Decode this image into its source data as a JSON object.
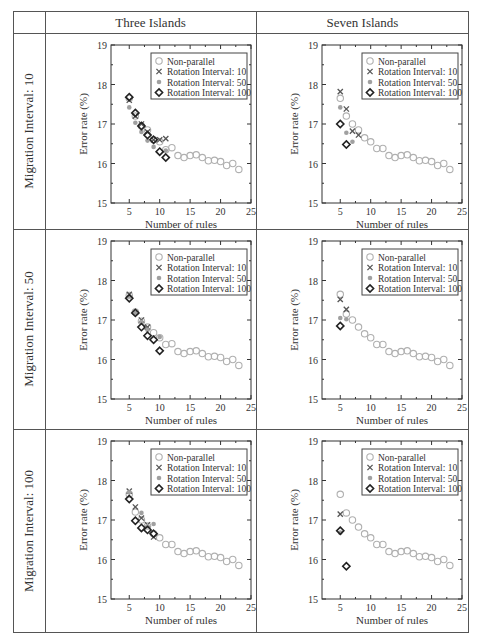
{
  "header": {
    "columns": [
      "Three Islands",
      "Seven Islands"
    ],
    "rows": [
      "Migration Interval: 10",
      "Migration Interval: 50",
      "Migration Interval: 100"
    ]
  },
  "axes": {
    "xlabel": "Number of rules",
    "ylabel": "Error rate (%)",
    "xlim": [
      2,
      25
    ],
    "ylim": [
      15,
      19
    ],
    "xticks": [
      5,
      10,
      15,
      20,
      25
    ],
    "yticks": [
      15,
      16,
      17,
      18,
      19
    ]
  },
  "legend": [
    {
      "name": "Non-parallel",
      "marker": "circle-open",
      "color": "#b0b0b0"
    },
    {
      "name": "Rotation Interval: 10",
      "marker": "x",
      "color": "#555555"
    },
    {
      "name": "Rotation Interval: 50",
      "marker": "dot",
      "color": "#a0a0a0"
    },
    {
      "name": "Rotation Interval: 100",
      "marker": "diamond-open",
      "color": "#222222"
    }
  ],
  "chart_data": [
    {
      "type": "scatter",
      "row": "Migration Interval: 10",
      "column": "Three Islands",
      "xlabel": "Number of rules",
      "ylabel": "Error rate (%)",
      "xlim": [
        2,
        25
      ],
      "ylim": [
        15,
        19
      ],
      "series": [
        {
          "name": "Non-parallel",
          "x": [
            5,
            6,
            7,
            8,
            9,
            10,
            11,
            12,
            13,
            14,
            15,
            16,
            17,
            18,
            19,
            20,
            21,
            22,
            23
          ],
          "y": [
            17.65,
            17.2,
            16.95,
            16.85,
            16.6,
            16.55,
            16.35,
            16.4,
            16.2,
            16.15,
            16.2,
            16.22,
            16.15,
            16.07,
            16.08,
            16.05,
            15.95,
            16.0,
            15.85
          ]
        },
        {
          "name": "Rotation Interval: 10",
          "x": [
            5,
            6,
            7,
            8,
            9,
            10,
            11
          ],
          "y": [
            17.6,
            17.2,
            17.0,
            16.8,
            16.6,
            16.6,
            16.63
          ]
        },
        {
          "name": "Rotation Interval: 50",
          "x": [
            5,
            6,
            7,
            8,
            9,
            11
          ],
          "y": [
            17.42,
            17.03,
            16.8,
            16.58,
            16.42,
            16.33
          ]
        },
        {
          "name": "Rotation Interval: 100",
          "x": [
            5,
            6,
            7,
            8,
            9,
            10,
            11
          ],
          "y": [
            17.68,
            17.28,
            16.95,
            16.72,
            16.6,
            16.3,
            16.15
          ]
        }
      ]
    },
    {
      "type": "scatter",
      "row": "Migration Interval: 10",
      "column": "Seven Islands",
      "xlabel": "Number of rules",
      "ylabel": "Error rate (%)",
      "xlim": [
        2,
        25
      ],
      "ylim": [
        15,
        19
      ],
      "series": [
        {
          "name": "Non-parallel",
          "x": [
            5,
            6,
            7,
            8,
            9,
            10,
            11,
            12,
            13,
            14,
            15,
            16,
            17,
            18,
            19,
            20,
            21,
            22,
            23
          ],
          "y": [
            17.65,
            17.2,
            17.0,
            16.85,
            16.65,
            16.55,
            16.38,
            16.38,
            16.2,
            16.15,
            16.2,
            16.22,
            16.15,
            16.07,
            16.08,
            16.05,
            15.95,
            16.0,
            15.85
          ]
        },
        {
          "name": "Rotation Interval: 10",
          "x": [
            5,
            6,
            7,
            8
          ],
          "y": [
            17.82,
            17.38,
            16.82,
            16.72
          ]
        },
        {
          "name": "Rotation Interval: 50",
          "x": [
            5,
            6,
            7
          ],
          "y": [
            17.42,
            16.78,
            16.55
          ]
        },
        {
          "name": "Rotation Interval: 100",
          "x": [
            5,
            6
          ],
          "y": [
            17.0,
            16.48
          ]
        }
      ]
    },
    {
      "type": "scatter",
      "row": "Migration Interval: 50",
      "column": "Three Islands",
      "xlabel": "Number of rules",
      "ylabel": "Error rate (%)",
      "xlim": [
        2,
        25
      ],
      "ylim": [
        15,
        19
      ],
      "series": [
        {
          "name": "Non-parallel",
          "x": [
            5,
            6,
            7,
            8,
            9,
            10,
            11,
            12,
            13,
            14,
            15,
            16,
            17,
            18,
            19,
            20,
            21,
            22,
            23
          ],
          "y": [
            17.62,
            17.2,
            16.97,
            16.82,
            16.68,
            16.55,
            16.38,
            16.4,
            16.2,
            16.15,
            16.2,
            16.22,
            16.15,
            16.07,
            16.08,
            16.05,
            15.95,
            16.0,
            15.85
          ]
        },
        {
          "name": "Rotation Interval: 10",
          "x": [
            5,
            7,
            8
          ],
          "y": [
            17.65,
            17.0,
            16.82
          ]
        },
        {
          "name": "Rotation Interval: 50",
          "x": [
            5,
            6,
            7,
            8,
            10
          ],
          "y": [
            17.6,
            17.18,
            16.95,
            16.75,
            16.57
          ]
        },
        {
          "name": "Rotation Interval: 100",
          "x": [
            5,
            6,
            7,
            8,
            9,
            10
          ],
          "y": [
            17.55,
            17.18,
            16.82,
            16.6,
            16.5,
            16.22
          ]
        }
      ]
    },
    {
      "type": "scatter",
      "row": "Migration Interval: 50",
      "column": "Seven Islands",
      "xlabel": "Number of rules",
      "ylabel": "Error rate (%)",
      "xlim": [
        2,
        25
      ],
      "ylim": [
        15,
        19
      ],
      "series": [
        {
          "name": "Non-parallel",
          "x": [
            5,
            6,
            7,
            8,
            9,
            10,
            11,
            12,
            13,
            14,
            15,
            16,
            17,
            18,
            19,
            20,
            21,
            22,
            23
          ],
          "y": [
            17.65,
            17.15,
            17.0,
            16.82,
            16.65,
            16.55,
            16.38,
            16.38,
            16.2,
            16.15,
            16.2,
            16.22,
            16.15,
            16.07,
            16.08,
            16.05,
            15.95,
            16.0,
            15.85
          ]
        },
        {
          "name": "Rotation Interval: 10",
          "x": [
            5,
            6
          ],
          "y": [
            17.52,
            17.27
          ]
        },
        {
          "name": "Rotation Interval: 50",
          "x": [
            5,
            6
          ],
          "y": [
            17.05,
            17.02
          ]
        },
        {
          "name": "Rotation Interval: 100",
          "x": [
            5
          ],
          "y": [
            16.85
          ]
        }
      ]
    },
    {
      "type": "scatter",
      "row": "Migration Interval: 100",
      "column": "Three Islands",
      "xlabel": "Number of rules",
      "ylabel": "Error rate (%)",
      "xlim": [
        2,
        25
      ],
      "ylim": [
        15,
        19
      ],
      "series": [
        {
          "name": "Non-parallel",
          "x": [
            5,
            6,
            7,
            8,
            9,
            10,
            11,
            12,
            13,
            14,
            15,
            16,
            17,
            18,
            19,
            20,
            21,
            22,
            23
          ],
          "y": [
            17.65,
            17.2,
            17.0,
            16.85,
            16.65,
            16.55,
            16.38,
            16.38,
            16.2,
            16.15,
            16.2,
            16.22,
            16.15,
            16.07,
            16.08,
            16.05,
            15.95,
            16.0,
            15.85
          ]
        },
        {
          "name": "Rotation Interval: 10",
          "x": [
            5,
            6,
            7,
            8,
            9
          ],
          "y": [
            17.73,
            17.33,
            17.05,
            16.88,
            16.57
          ]
        },
        {
          "name": "Rotation Interval: 50",
          "x": [
            5,
            7,
            8,
            9
          ],
          "y": [
            17.7,
            17.18,
            16.85,
            16.9
          ]
        },
        {
          "name": "Rotation Interval: 100",
          "x": [
            5,
            6,
            7,
            8,
            9
          ],
          "y": [
            17.53,
            16.98,
            16.8,
            16.75,
            16.65
          ]
        }
      ]
    },
    {
      "type": "scatter",
      "row": "Migration Interval: 100",
      "column": "Seven Islands",
      "xlabel": "Number of rules",
      "ylabel": "Error rate (%)",
      "xlim": [
        2,
        25
      ],
      "ylim": [
        15,
        19
      ],
      "series": [
        {
          "name": "Non-parallel",
          "x": [
            5,
            6,
            7,
            8,
            9,
            10,
            11,
            12,
            13,
            14,
            15,
            16,
            17,
            18,
            19,
            20,
            21,
            22,
            23
          ],
          "y": [
            17.65,
            17.18,
            17.0,
            16.82,
            16.65,
            16.55,
            16.38,
            16.38,
            16.2,
            16.15,
            16.2,
            16.22,
            16.15,
            16.07,
            16.08,
            16.05,
            15.95,
            16.0,
            15.85
          ]
        },
        {
          "name": "Rotation Interval: 10",
          "x": [
            5
          ],
          "y": [
            17.15
          ]
        },
        {
          "name": "Rotation Interval: 50",
          "x": [
            5
          ],
          "y": [
            16.68
          ]
        },
        {
          "name": "Rotation Interval: 100",
          "x": [
            5,
            6
          ],
          "y": [
            16.73,
            15.83
          ]
        }
      ]
    }
  ]
}
